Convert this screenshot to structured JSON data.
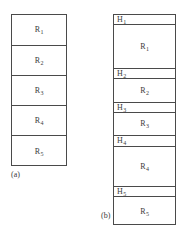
{
  "figure": {
    "panels": [
      {
        "id": "panel-a",
        "caption": "(a)",
        "description": "records without headers",
        "rows": [
          {
            "kind": "record",
            "label": "R",
            "index": "1"
          },
          {
            "kind": "record",
            "label": "R",
            "index": "2"
          },
          {
            "kind": "record",
            "label": "R",
            "index": "3"
          },
          {
            "kind": "record",
            "label": "R",
            "index": "4"
          },
          {
            "kind": "record",
            "label": "R",
            "index": "5"
          }
        ]
      },
      {
        "id": "panel-b",
        "caption": "(b)",
        "description": "records preceded by headers",
        "rows": [
          {
            "kind": "header",
            "label": "H",
            "index": "1"
          },
          {
            "kind": "record",
            "label": "R",
            "index": "1"
          },
          {
            "kind": "header",
            "label": "H",
            "index": "2"
          },
          {
            "kind": "record",
            "label": "R",
            "index": "2"
          },
          {
            "kind": "header",
            "label": "H",
            "index": "3"
          },
          {
            "kind": "record",
            "label": "R",
            "index": "3"
          },
          {
            "kind": "header",
            "label": "H",
            "index": "4"
          },
          {
            "kind": "record",
            "label": "R",
            "index": "4"
          },
          {
            "kind": "header",
            "label": "H",
            "index": "5"
          },
          {
            "kind": "record",
            "label": "R",
            "index": "5"
          }
        ]
      }
    ]
  },
  "panel_a": {
    "caption": "(a)",
    "cells": [
      {
        "text": "R",
        "sub": "1",
        "top": 0,
        "height": 31
      },
      {
        "text": "R",
        "sub": "2",
        "top": 31,
        "height": 30
      },
      {
        "text": "R",
        "sub": "3",
        "top": 61,
        "height": 30
      },
      {
        "text": "R",
        "sub": "4",
        "top": 91,
        "height": 30
      },
      {
        "text": "R",
        "sub": "5",
        "top": 121,
        "height": 31
      }
    ]
  },
  "panel_b": {
    "caption": "(b)",
    "cells": [
      {
        "text": "H",
        "sub": "1",
        "top": 0,
        "height": 10,
        "align": "left"
      },
      {
        "text": "R",
        "sub": "1",
        "top": 10,
        "height": 44,
        "align": "center"
      },
      {
        "text": "H",
        "sub": "2",
        "top": 54,
        "height": 10,
        "align": "left"
      },
      {
        "text": "R",
        "sub": "2",
        "top": 64,
        "height": 24,
        "align": "center"
      },
      {
        "text": "H",
        "sub": "3",
        "top": 88,
        "height": 10,
        "align": "left"
      },
      {
        "text": "R",
        "sub": "3",
        "top": 98,
        "height": 23,
        "align": "center"
      },
      {
        "text": "H",
        "sub": "4",
        "top": 121,
        "height": 11,
        "align": "left"
      },
      {
        "text": "R",
        "sub": "4",
        "top": 132,
        "height": 40,
        "align": "center"
      },
      {
        "text": "H",
        "sub": "5",
        "top": 172,
        "height": 10,
        "align": "left"
      },
      {
        "text": "R",
        "sub": "5",
        "top": 182,
        "height": 29,
        "align": "center"
      }
    ]
  },
  "colors": {
    "background": "#ffffff",
    "stroke": "#4a4a4a",
    "text": "#3a3a3a"
  }
}
